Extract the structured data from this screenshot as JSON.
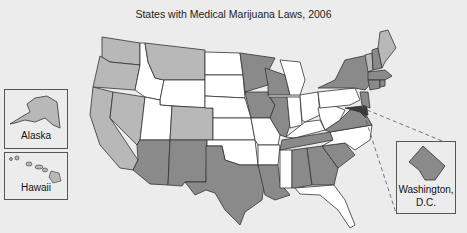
{
  "title": "States with Medical Marijuana Laws, 2006",
  "colors": {
    "background": "#ececec",
    "no_law": "#ffffff",
    "category_light": "#b8b8b8",
    "category_medium": "#8a8a8a",
    "category_dark": "#3a3a3a",
    "border": "#333333"
  },
  "insets": {
    "alaska": {
      "label": "Alaska"
    },
    "hawaii": {
      "label": "Hawaii"
    },
    "dc": {
      "label": "Washington,\nD.C.",
      "label_line1": "Washington,",
      "label_line2": "D.C."
    }
  },
  "map_data": {
    "light_gray_states": [
      "Alaska",
      "Hawaii",
      "Washington",
      "Oregon",
      "California",
      "Nevada",
      "Montana",
      "Colorado",
      "Vermont",
      "Maine"
    ],
    "medium_gray_states": [
      "Arizona",
      "New Mexico",
      "Texas",
      "Minnesota",
      "Wisconsin",
      "Iowa",
      "Illinois",
      "Louisiana",
      "Alabama",
      "Georgia",
      "South Carolina",
      "Tennessee",
      "Virginia",
      "New York",
      "New Hampshire",
      "Massachusetts",
      "Connecticut",
      "Rhode Island",
      "New Jersey",
      "District of Columbia"
    ],
    "dark_gray_states": [
      "Maryland",
      "Delaware"
    ],
    "white_states": [
      "Idaho",
      "Utah",
      "Wyoming",
      "North Dakota",
      "South Dakota",
      "Nebraska",
      "Kansas",
      "Oklahoma",
      "Missouri",
      "Arkansas",
      "Mississippi",
      "Michigan",
      "Indiana",
      "Ohio",
      "Kentucky",
      "West Virginia",
      "Pennsylvania",
      "North Carolina",
      "Florida"
    ]
  }
}
